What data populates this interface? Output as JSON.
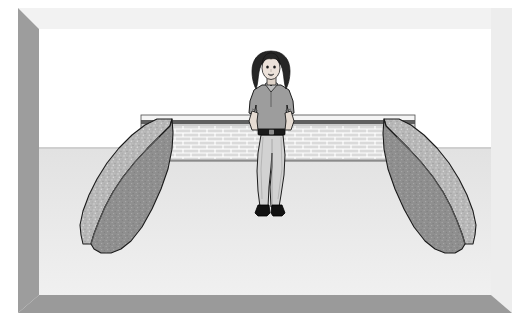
{
  "artwork": {
    "title": "Woman standing in walled courtyard",
    "medium": "clip-art line illustration",
    "palette": {
      "background": "#ffffff",
      "frame_light": "#f0f0f0",
      "frame_shadow": "#9a9a9a",
      "ground": "#e9e9e9",
      "brick_light": "#dcdcdc",
      "brick_mortar": "#ffffff",
      "brick_cap_dark": "#5f5f5f",
      "stone_top": "#b5b5b5",
      "stone_face": "#8f8f8f",
      "outline": "#1a1a1a",
      "skin": "#e8ded6",
      "hair": "#2b2b2b",
      "shirt": "#9a9a9a",
      "pants": "#cfcfcf",
      "belt": "#1c1c1c",
      "shoes": "#111111"
    }
  },
  "frame": {
    "name": "beveled-picture-frame",
    "top_label": "frame top bevel",
    "right_label": "frame right bevel",
    "bottom_label": "frame bottom bevel",
    "left_label": "frame left bevel"
  },
  "scene": {
    "ground": {
      "label": "courtyard floor",
      "color": "#e9e9e9"
    },
    "sky": {
      "label": "blank background",
      "color": "#ffffff"
    },
    "brick_wall": {
      "label": "brick retaining wall",
      "courses": 9,
      "bond": "running bond",
      "cap_label": "wall cap coping",
      "color": "#dcdcdc",
      "mortar_color": "#ffffff"
    },
    "stone_wall_left": {
      "label": "left stone wall",
      "top_face_color": "#b7b7b7",
      "side_face_color": "#8c8c8c"
    },
    "stone_wall_right": {
      "label": "right stone wall",
      "top_face_color": "#b7b7b7",
      "side_face_color": "#8c8c8c"
    },
    "figure": {
      "label": "standing woman",
      "pose": "standing, hands on hips",
      "hair": "long dark wavy hair",
      "top": "gray short-sleeve polo shirt",
      "bottom": "light gray trousers",
      "belt": "dark belt",
      "shoes": "black shoes"
    }
  },
  "caption": ""
}
